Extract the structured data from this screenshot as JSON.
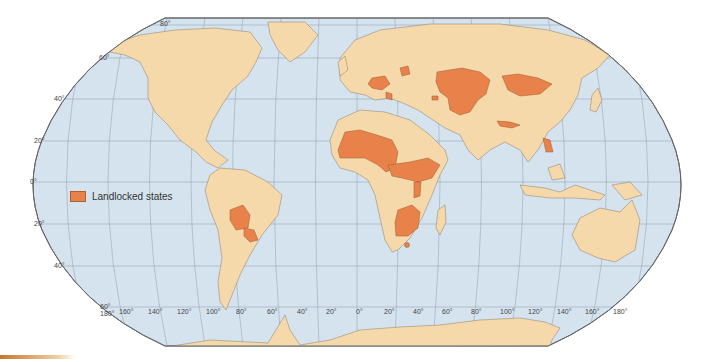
{
  "map": {
    "projection": "Robinson",
    "colors": {
      "ocean": "#d5e3ef",
      "land": "#f6d9ab",
      "landlocked": "#e8824a",
      "border": "#8a7a66",
      "graticule": "#9aa8b6",
      "coast_water": "#3f7fc4"
    },
    "latitude_labels": [
      "80°",
      "60°",
      "40°",
      "20°",
      "0°",
      "20°",
      "40°",
      "60°"
    ],
    "longitude_labels": [
      "180°",
      "160°",
      "140°",
      "120°",
      "100°",
      "80°",
      "60°",
      "40°",
      "20°",
      "0°",
      "20°",
      "40°",
      "60°",
      "80°",
      "100°",
      "120°",
      "140°",
      "160°",
      "180°"
    ],
    "legend": {
      "label": "Landlocked states",
      "color": "#e8824a"
    },
    "highlighted_regions": [
      "Bolivia",
      "Paraguay",
      "Mali",
      "Burkina Faso",
      "Niger",
      "Chad",
      "Central African Republic",
      "South Sudan",
      "Ethiopia",
      "Uganda",
      "Rwanda",
      "Burundi",
      "Zambia",
      "Malawi",
      "Zimbabwe",
      "Botswana",
      "Lesotho",
      "Eswatini",
      "Belarus",
      "Czech Republic",
      "Slovakia",
      "Hungary",
      "Austria",
      "Switzerland",
      "Serbia",
      "North Macedonia",
      "Moldova",
      "Armenia",
      "Azerbaijan",
      "Kazakhstan",
      "Uzbekistan",
      "Turkmenistan",
      "Kyrgyzstan",
      "Tajikistan",
      "Afghanistan",
      "Mongolia",
      "Nepal",
      "Bhutan",
      "Laos"
    ]
  }
}
